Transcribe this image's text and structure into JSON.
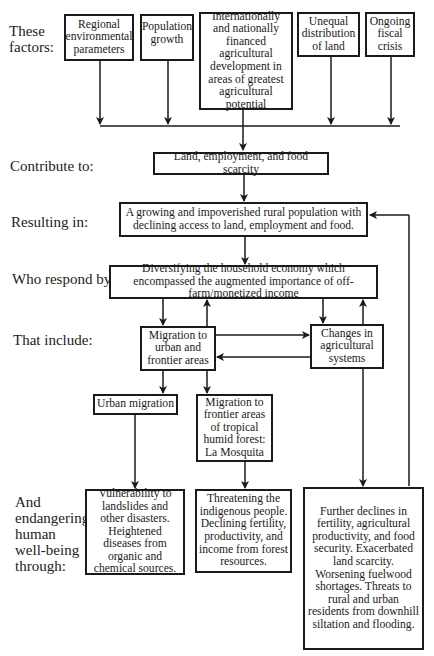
{
  "stage_labels": {
    "factors": "These factors:",
    "contribute": "Contribute to:",
    "resulting": "Resulting in:",
    "respond": "Who respond by:",
    "include": "That include:",
    "endangering": "And endangering human well-being through:"
  },
  "factors": [
    {
      "id": "regional",
      "text": "Regional environmental parameters"
    },
    {
      "id": "population",
      "text": "Population growth"
    },
    {
      "id": "financed-development",
      "text": "Internationally and nationally financed agricultural development in areas of greatest agricultural potential"
    },
    {
      "id": "land-distribution",
      "text": "Unequal distribution of land"
    },
    {
      "id": "fiscal-crisis",
      "text": "Ongoing fiscal crisis"
    }
  ],
  "scarcity": {
    "text": "Land, employment, and food scarcity"
  },
  "rural_population": {
    "text": "A growing and impoverished rural population with declining access to land, employment and food."
  },
  "diversifying": {
    "text": "Diversifying the household economy which encompassed the augmented importance of off-farm/monetized income"
  },
  "migration": {
    "text": "Migration to urban and frontier areas"
  },
  "agri_changes": {
    "text": "Changes in agricultural systems"
  },
  "urban_migration": {
    "text": "Urban migration"
  },
  "frontier_migration": {
    "text": "Migration to frontier areas of tropical humid forest: La Mosquita"
  },
  "outcomes": {
    "urban": "Vulnerability to landslides and other disasters. Heightened diseases from organic and chemical sources.",
    "frontier": "Threatening the indigenous people. Declining fertility, productivity, and income from forest resources.",
    "agri": "Further declines in fertility, agricultural productivity, and food security. Exacerbated land scarcity. Worsening fuelwood shortages. Threats to rural and urban residents from downhill siltation and flooding."
  },
  "colors": {
    "line": "#1a1a1a",
    "background": "#ffffff"
  }
}
